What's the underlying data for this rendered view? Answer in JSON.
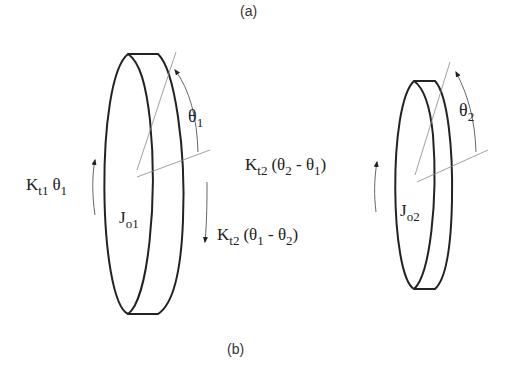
{
  "captions": {
    "top": "(a)",
    "bottom": "(b)"
  },
  "disk1": {
    "inertia": {
      "main": "J",
      "sub": "o1"
    },
    "angle": {
      "main": "θ",
      "sub": "1"
    },
    "torque_left": {
      "k": "K",
      "ksub": "t1",
      "theta": "θ",
      "thsub": "1"
    },
    "torque_right": {
      "k": "K",
      "ksub": "t2",
      "open": "(θ",
      "s1": "1",
      "minus": " - θ",
      "s2": "2",
      "close": ")"
    }
  },
  "disk2": {
    "inertia": {
      "main": "J",
      "sub": "o2"
    },
    "angle": {
      "main": "θ",
      "sub": "2"
    },
    "torque_left": {
      "k": "K",
      "ksub": "t2",
      "open": "(θ",
      "s1": "2",
      "minus": " - θ",
      "s2": "1",
      "close": ")"
    }
  }
}
